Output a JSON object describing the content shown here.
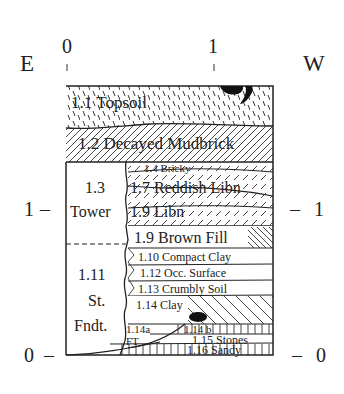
{
  "figure": {
    "orientation": {
      "left": "E",
      "right": "W"
    },
    "top_scale": [
      {
        "label": "0"
      },
      {
        "label": "1"
      }
    ],
    "left_scale": [
      {
        "label": "1"
      },
      {
        "label": "0"
      }
    ],
    "right_scale": [
      {
        "label": "1"
      },
      {
        "label": "0"
      }
    ],
    "tick_mark": "–",
    "layers": [
      {
        "id": "1.1",
        "label": "1.1 Topsoil"
      },
      {
        "id": "1.2",
        "label": "1.2 Decayed Mudbrick"
      },
      {
        "id": "1.4",
        "label": "1.4 Bricky"
      },
      {
        "id": "1.7",
        "label": "1.7 Reddish Libn"
      },
      {
        "id": "1.9a",
        "label": "1.9 Libn"
      },
      {
        "id": "1.9b",
        "label": "1.9 Brown Fill"
      },
      {
        "id": "1.10",
        "label": "1.10 Compact Clay"
      },
      {
        "id": "1.12",
        "label": "1.12 Occ. Surface"
      },
      {
        "id": "1.13",
        "label": "1.13 Crumbly Soil"
      },
      {
        "id": "1.14",
        "label": "1.14 Clay"
      },
      {
        "id": "1.14a",
        "label": "1.14a"
      },
      {
        "id": "FT",
        "label": "FT"
      },
      {
        "id": "1.14b",
        "label": "1.14 b"
      },
      {
        "id": "1.15",
        "label": "1.15 Stones"
      },
      {
        "id": "1.16",
        "label": "1.16 Sandy"
      }
    ],
    "tower": {
      "line1": "1.3",
      "line2": "Tower"
    },
    "foundation": {
      "line1": "1.11",
      "line2": "St.",
      "line3": "Fndt."
    }
  }
}
